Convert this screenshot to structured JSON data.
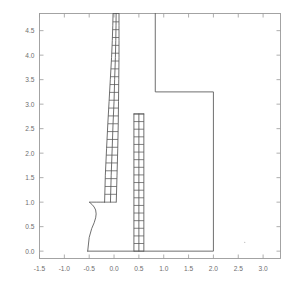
{
  "chart_data": {
    "type": "line",
    "title": "",
    "subtitle": "",
    "xlabel": "",
    "ylabel": "",
    "xlim": [
      -1.5,
      3.35
    ],
    "ylim": [
      -0.15,
      4.85
    ],
    "grid": false,
    "legend": null,
    "legend_position": "none",
    "axis": {
      "frame": true,
      "ticks_inward": true,
      "x_ticks": [
        -1.5,
        -1.0,
        -0.5,
        0.0,
        0.5,
        1.0,
        1.5,
        2.0,
        2.5,
        3.0
      ],
      "x_tick_labels": [
        "-1.5",
        "-1.0",
        "-0.5",
        "0.0",
        "0.5",
        "1.0",
        "1.5",
        "2.0",
        "2.5",
        "3.0"
      ],
      "y_ticks": [
        0.0,
        0.5,
        1.0,
        1.5,
        2.0,
        2.5,
        3.0,
        3.5,
        4.0,
        4.5
      ],
      "y_tick_labels": [
        "0.0",
        "0.5",
        "1.0",
        "1.5",
        "2.0",
        "2.5",
        "3.0",
        "3.5",
        "4.0",
        "4.5"
      ],
      "line_color": "#9a9a9a",
      "tick_label_color": "#6e6e6e"
    },
    "series": [
      {
        "name": "outer-boundary",
        "type": "polyline",
        "color": "#555555",
        "x": [
          0.83,
          0.83,
          2.0,
          2.0,
          -0.53
        ],
        "y": [
          4.85,
          3.25,
          3.25,
          0.0,
          0.0
        ]
      },
      {
        "name": "nose-curve",
        "type": "polyline",
        "color": "#555555",
        "x": [
          -0.53,
          -0.5,
          -0.45,
          -0.4,
          -0.37,
          -0.36,
          -0.37,
          -0.4,
          -0.44,
          -0.48,
          -0.5,
          -0.45,
          -0.36,
          -0.28,
          -0.22,
          -0.19
        ],
        "y": [
          0.0,
          0.28,
          0.46,
          0.58,
          0.68,
          0.76,
          0.84,
          0.9,
          0.95,
          0.985,
          1.0,
          1.0,
          1.0,
          1.0,
          1.0,
          1.0
        ]
      },
      {
        "name": "left-strip-inner-edge",
        "type": "polyline",
        "color": "#555555",
        "x": [
          -0.19,
          -0.175,
          -0.15,
          -0.125,
          -0.1,
          -0.075,
          -0.05,
          -0.035,
          -0.025,
          -0.02
        ],
        "y": [
          1.0,
          1.55,
          2.1,
          2.6,
          3.05,
          3.5,
          3.95,
          4.3,
          4.6,
          4.85
        ]
      },
      {
        "name": "left-strip-outer-edge",
        "type": "polyline",
        "color": "#555555",
        "x": [
          0.045,
          0.06,
          0.075,
          0.085,
          0.09,
          0.095,
          0.1,
          0.1,
          0.1,
          0.1
        ],
        "y": [
          1.0,
          1.55,
          2.1,
          2.6,
          3.05,
          3.5,
          3.95,
          4.3,
          4.6,
          4.85
        ]
      },
      {
        "name": "left-strip-mid-edge",
        "type": "polyline",
        "color": "#555555",
        "x": [
          -0.072,
          -0.057,
          -0.037,
          -0.02,
          0.0,
          0.012,
          0.027,
          0.035,
          0.04,
          0.042
        ],
        "y": [
          1.0,
          1.55,
          2.1,
          2.6,
          3.05,
          3.5,
          3.95,
          4.3,
          4.6,
          4.85
        ]
      },
      {
        "name": "left-strip-rungs",
        "type": "rungs",
        "color": "#555555",
        "y": [
          1.0,
          1.16,
          1.32,
          1.48,
          1.64,
          1.8,
          1.96,
          2.12,
          2.28,
          2.44,
          2.6,
          2.76,
          2.92,
          3.08,
          3.24,
          3.4,
          3.56,
          3.72,
          3.88,
          4.04,
          4.2,
          4.36,
          4.52,
          4.68,
          4.85
        ]
      },
      {
        "name": "right-strip-left-edge",
        "type": "polyline",
        "color": "#555555",
        "x": [
          0.4,
          0.4
        ],
        "y": [
          0.0,
          2.8
        ]
      },
      {
        "name": "right-strip-mid-edge",
        "type": "polyline",
        "color": "#555555",
        "x": [
          0.5,
          0.5
        ],
        "y": [
          0.0,
          2.8
        ]
      },
      {
        "name": "right-strip-right-edge",
        "type": "polyline",
        "color": "#555555",
        "x": [
          0.6,
          0.6
        ],
        "y": [
          0.0,
          2.8
        ]
      },
      {
        "name": "right-strip-rungs",
        "type": "rungs",
        "color": "#555555",
        "y": [
          0.0,
          0.156,
          0.311,
          0.467,
          0.622,
          0.778,
          0.933,
          1.089,
          1.244,
          1.4,
          1.556,
          1.711,
          1.867,
          2.022,
          2.178,
          2.333,
          2.489,
          2.644,
          2.8
        ]
      },
      {
        "name": "right-strip-cap",
        "type": "polyline",
        "color": "#555555",
        "x": [
          0.4,
          0.6
        ],
        "y": [
          2.8,
          2.8
        ]
      }
    ],
    "annotations": [
      {
        "name": "stray-dot",
        "x": 2.63,
        "y": 0.18,
        "color": "#bdbdbd"
      }
    ]
  }
}
